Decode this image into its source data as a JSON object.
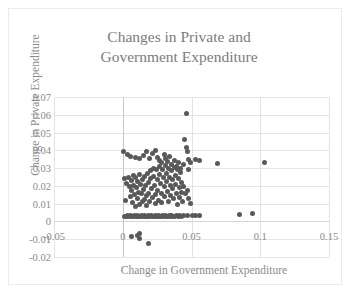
{
  "chart_data": {
    "type": "scatter",
    "title": "Changes in Private and Government Expenditure",
    "title_line1": "Changes in Private and",
    "title_line2": "Government Expenditure",
    "xlabel": "Change in Government Expenditure",
    "ylabel": "Change in Private Expenditure",
    "xlim": [
      -0.05,
      0.15
    ],
    "ylim": [
      -0.02,
      0.07
    ],
    "xticks": [
      "-0.05",
      "0",
      "0.05",
      "0.1",
      "0.15"
    ],
    "xtick_values": [
      -0.05,
      0,
      0.05,
      0.1,
      0.15
    ],
    "yticks": [
      "0.07",
      "0.06",
      "0.05",
      "0.04",
      "0.03",
      "0.02",
      "0.01",
      "0",
      "-0.01",
      "-0.02"
    ],
    "ytick_values": [
      0.07,
      0.06,
      0.05,
      0.04,
      0.03,
      0.02,
      0.01,
      0,
      -0.01,
      -0.02
    ],
    "grid": true,
    "legend": false,
    "marker_color": "#595959",
    "marker_size": 5,
    "title_color": "#7b7b7b",
    "label_color": "#8a8a8a",
    "gridline_color": "#e6e6e6",
    "points": [
      [
        0.0005,
        0.0395
      ],
      [
        0.0035,
        0.0375
      ],
      [
        0.0055,
        0.0365
      ],
      [
        0.009,
        0.036
      ],
      [
        0.0125,
        0.0355
      ],
      [
        0.015,
        0.037
      ],
      [
        0.0175,
        0.0395
      ],
      [
        0.0195,
        0.0355
      ],
      [
        0.0215,
        0.0385
      ],
      [
        0.0235,
        0.04
      ],
      [
        0.025,
        0.036
      ],
      [
        0.027,
        0.0345
      ],
      [
        0.0285,
        0.033
      ],
      [
        0.03,
        0.0375
      ],
      [
        0.031,
        0.0355
      ],
      [
        0.0325,
        0.034
      ],
      [
        0.034,
        0.0365
      ],
      [
        0.0355,
        0.032
      ],
      [
        0.0375,
        0.0345
      ],
      [
        0.039,
        0.031
      ],
      [
        0.0405,
        0.033
      ],
      [
        0.042,
        0.03
      ],
      [
        0.044,
        0.032
      ],
      [
        0.0465,
        0.0605
      ],
      [
        0.045,
        0.046
      ],
      [
        0.046,
        0.0415
      ],
      [
        0.047,
        0.0395
      ],
      [
        0.048,
        0.035
      ],
      [
        0.049,
        0.033
      ],
      [
        0.0475,
        0.029
      ],
      [
        0.053,
        0.035
      ],
      [
        0.056,
        0.0345
      ],
      [
        0.069,
        0.0325
      ],
      [
        0.103,
        0.033
      ],
      [
        0.0015,
        0.024
      ],
      [
        0.002,
        0.012
      ],
      [
        0.003,
        0.0215
      ],
      [
        0.004,
        0.025
      ],
      [
        0.005,
        0.0195
      ],
      [
        0.0055,
        0.014
      ],
      [
        0.006,
        0.023
      ],
      [
        0.0065,
        0.0175
      ],
      [
        0.007,
        0.0105
      ],
      [
        0.0075,
        0.026
      ],
      [
        0.008,
        0.0205
      ],
      [
        0.0085,
        0.015
      ],
      [
        0.009,
        0.0085
      ],
      [
        0.0095,
        0.0245
      ],
      [
        0.01,
        0.019
      ],
      [
        0.0105,
        0.013
      ],
      [
        0.011,
        0.0225
      ],
      [
        0.0115,
        0.0165
      ],
      [
        0.012,
        0.0095
      ],
      [
        0.0125,
        0.0265
      ],
      [
        0.013,
        0.021
      ],
      [
        0.0135,
        0.0155
      ],
      [
        0.014,
        0.011
      ],
      [
        0.0145,
        0.0235
      ],
      [
        0.015,
        0.018
      ],
      [
        0.0155,
        0.0125
      ],
      [
        0.016,
        0.0255
      ],
      [
        0.0165,
        0.02
      ],
      [
        0.017,
        0.0145
      ],
      [
        0.0175,
        0.009
      ],
      [
        0.018,
        0.027
      ],
      [
        0.0185,
        0.022
      ],
      [
        0.019,
        0.016
      ],
      [
        0.0195,
        0.0115
      ],
      [
        0.02,
        0.0285
      ],
      [
        0.0205,
        0.024
      ],
      [
        0.021,
        0.0185
      ],
      [
        0.0215,
        0.0135
      ],
      [
        0.022,
        0.03
      ],
      [
        0.0225,
        0.0255
      ],
      [
        0.023,
        0.0205
      ],
      [
        0.0235,
        0.015
      ],
      [
        0.024,
        0.01
      ],
      [
        0.0245,
        0.029
      ],
      [
        0.025,
        0.0235
      ],
      [
        0.0255,
        0.0175
      ],
      [
        0.026,
        0.012
      ],
      [
        0.0265,
        0.031
      ],
      [
        0.027,
        0.0265
      ],
      [
        0.0275,
        0.0215
      ],
      [
        0.028,
        0.016
      ],
      [
        0.0285,
        0.0105
      ],
      [
        0.029,
        0.0295
      ],
      [
        0.0295,
        0.0245
      ],
      [
        0.03,
        0.0195
      ],
      [
        0.0305,
        0.014
      ],
      [
        0.031,
        0.0315
      ],
      [
        0.0315,
        0.027
      ],
      [
        0.032,
        0.0225
      ],
      [
        0.0325,
        0.017
      ],
      [
        0.033,
        0.0115
      ],
      [
        0.0335,
        0.03
      ],
      [
        0.034,
        0.025
      ],
      [
        0.0345,
        0.02
      ],
      [
        0.035,
        0.0145
      ],
      [
        0.0355,
        0.0285
      ],
      [
        0.036,
        0.0235
      ],
      [
        0.0365,
        0.0185
      ],
      [
        0.037,
        0.013
      ],
      [
        0.0375,
        0.0305
      ],
      [
        0.038,
        0.026
      ],
      [
        0.0385,
        0.021
      ],
      [
        0.039,
        0.0155
      ],
      [
        0.0395,
        0.0095
      ],
      [
        0.04,
        0.029
      ],
      [
        0.0405,
        0.024
      ],
      [
        0.041,
        0.019
      ],
      [
        0.0415,
        0.0135
      ],
      [
        0.042,
        0.0275
      ],
      [
        0.0425,
        0.022
      ],
      [
        0.043,
        0.0165
      ],
      [
        0.0435,
        0.011
      ],
      [
        0.0445,
        0.0195
      ],
      [
        0.0455,
        0.0155
      ],
      [
        0.047,
        0.0175
      ],
      [
        0.048,
        0.013
      ],
      [
        0.049,
        0.01
      ],
      [
        0.001,
        0.003
      ],
      [
        0.0025,
        0.0028
      ],
      [
        0.0038,
        0.0032
      ],
      [
        0.0048,
        0.0029
      ],
      [
        0.0058,
        0.0031
      ],
      [
        0.0068,
        0.003
      ],
      [
        0.0078,
        0.0028
      ],
      [
        0.0088,
        0.0032
      ],
      [
        0.0098,
        0.0029
      ],
      [
        0.0108,
        0.0031
      ],
      [
        0.0118,
        0.003
      ],
      [
        0.0128,
        0.0028
      ],
      [
        0.0138,
        0.0032
      ],
      [
        0.0148,
        0.0029
      ],
      [
        0.0158,
        0.0031
      ],
      [
        0.0168,
        0.003
      ],
      [
        0.0178,
        0.0028
      ],
      [
        0.0188,
        0.0032
      ],
      [
        0.0198,
        0.0029
      ],
      [
        0.0208,
        0.0031
      ],
      [
        0.0218,
        0.003
      ],
      [
        0.0228,
        0.0028
      ],
      [
        0.0238,
        0.0032
      ],
      [
        0.0248,
        0.0029
      ],
      [
        0.0258,
        0.0031
      ],
      [
        0.0268,
        0.003
      ],
      [
        0.0278,
        0.0028
      ],
      [
        0.0288,
        0.0032
      ],
      [
        0.0298,
        0.0029
      ],
      [
        0.0308,
        0.0031
      ],
      [
        0.0318,
        0.003
      ],
      [
        0.0328,
        0.0028
      ],
      [
        0.0338,
        0.0032
      ],
      [
        0.0348,
        0.0029
      ],
      [
        0.0358,
        0.0031
      ],
      [
        0.0368,
        0.003
      ],
      [
        0.0378,
        0.0028
      ],
      [
        0.039,
        0.0032
      ],
      [
        0.0402,
        0.0029
      ],
      [
        0.0415,
        0.0031
      ],
      [
        0.043,
        0.003
      ],
      [
        0.0445,
        0.0032
      ],
      [
        0.047,
        0.0035
      ],
      [
        0.0505,
        0.0033
      ],
      [
        0.053,
        0.0034
      ],
      [
        0.0555,
        0.0033
      ],
      [
        0.085,
        0.004
      ],
      [
        0.0945,
        0.0042
      ],
      [
        0.006,
        -0.0085
      ],
      [
        0.0105,
        -0.008
      ],
      [
        0.012,
        -0.007
      ],
      [
        0.0122,
        -0.0095
      ],
      [
        0.0185,
        -0.0125
      ]
    ]
  }
}
